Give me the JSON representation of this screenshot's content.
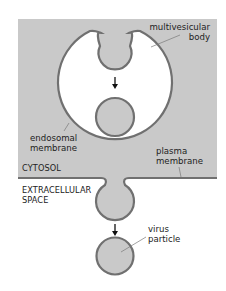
{
  "colors": {
    "cytosol": "#c9c9c9",
    "membrane": "#707070",
    "lumen": "#ffffff",
    "arrow": "#111111",
    "leader": "#7a7a7a",
    "text": "#222222"
  },
  "labels": {
    "multivesicular_body": [
      "multivesicular",
      "body"
    ],
    "endosomal_membrane": [
      "endosomal",
      "membrane"
    ],
    "cytosol": "CYTOSOL",
    "plasma_membrane": [
      "plasma",
      "membrane"
    ],
    "extracellular_space": [
      "EXTRACELLULAR",
      "SPACE"
    ],
    "virus_particle": [
      "virus",
      "particle"
    ]
  },
  "compartments": [
    "multivesicular body",
    "cytosol",
    "extracellular space"
  ],
  "arrows": [
    "inward budding into multivesicular body",
    "outward budding of virus particle"
  ]
}
